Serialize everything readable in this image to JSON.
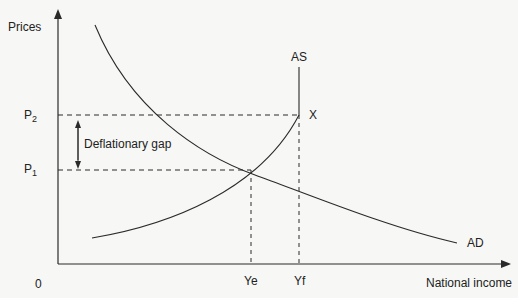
{
  "diagram": {
    "title": "",
    "y_axis_label": "Prices",
    "x_axis_label": "National income",
    "origin_label": "0",
    "price_levels": [
      {
        "id": "P2",
        "base": "P",
        "sub": "2"
      },
      {
        "id": "P1",
        "base": "P",
        "sub": "1"
      }
    ],
    "income_levels": {
      "Ye": "Ye",
      "Yf": "Yf"
    },
    "curves": {
      "AS": "AS",
      "AD": "AD"
    },
    "point_label": "X",
    "gap_label": "Deflationary gap",
    "colors": {
      "line": "#2a2a2a",
      "background": "#f7f7f5"
    }
  }
}
